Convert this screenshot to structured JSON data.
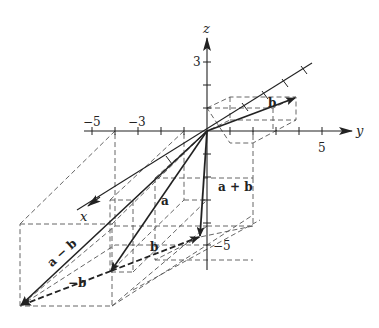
{
  "diagram": {
    "type": "3d-vector-addition",
    "axes": {
      "x": {
        "label": "x"
      },
      "y": {
        "label": "y",
        "tick_labels": [
          {
            "value": "5"
          },
          {
            "value": "−5"
          },
          {
            "value": "−3"
          }
        ]
      },
      "z": {
        "label": "z",
        "tick_labels": [
          {
            "value": "3"
          },
          {
            "value": "−5"
          }
        ]
      }
    },
    "vectors": [
      {
        "id": "a",
        "label": "a",
        "style": "solid"
      },
      {
        "id": "b",
        "label": "b",
        "style": "solid"
      },
      {
        "id": "a_plus_b",
        "label": "a + b",
        "style": "solid"
      },
      {
        "id": "a_minus_b",
        "label": "a − b",
        "style": "solid"
      },
      {
        "id": "b_translated",
        "label": "b",
        "style": "dashed"
      },
      {
        "id": "neg_b_translated",
        "label": "−b",
        "style": "dashed"
      }
    ],
    "colors": {
      "ink": "#222222",
      "dash": "#555555",
      "background": "#ffffff"
    }
  }
}
